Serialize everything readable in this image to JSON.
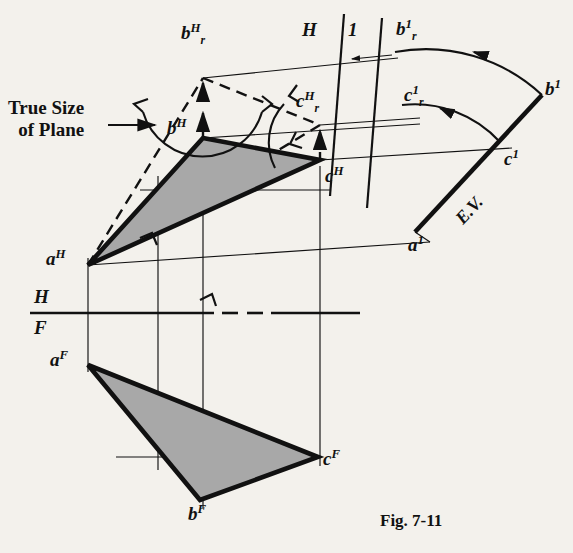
{
  "figure": {
    "caption": "Fig. 7-11",
    "paper_tint": "#f3f1ec",
    "ink_color": "#111111",
    "plane_fill": "#a8a8a8"
  },
  "annotations": {
    "true_size_line1": "True Size",
    "true_size_line2": "of Plane",
    "edge_view": "E.V.",
    "fold_h_top": "H",
    "fold_1_top": "1",
    "fold_h_lower": "H",
    "fold_f_lower": "F"
  },
  "points": {
    "a_h": {
      "base": "a",
      "sup": "H",
      "sub": "",
      "x": 88,
      "y": 265,
      "lx": 46,
      "ly": 248
    },
    "b_h": {
      "base": "b",
      "sup": "H",
      "sub": "",
      "x": 203,
      "y": 138,
      "lx": 167,
      "ly": 117
    },
    "c_h": {
      "base": "c",
      "sup": "H",
      "sub": "",
      "x": 320,
      "y": 160,
      "lx": 325,
      "ly": 165
    },
    "br_h": {
      "base": "b",
      "sup": "H",
      "sub": "r",
      "x": 203,
      "y": 78,
      "lx": 181,
      "ly": 22
    },
    "cr_h": {
      "base": "c",
      "sup": "H",
      "sub": "r",
      "x": 320,
      "y": 125,
      "lx": 296,
      "ly": 90
    },
    "a_1": {
      "base": "a",
      "sup": "1",
      "sub": "",
      "x": 415,
      "y": 232,
      "lx": 408,
      "ly": 234
    },
    "b_1": {
      "base": "b",
      "sup": "1",
      "sub": "",
      "x": 542,
      "y": 95,
      "lx": 545,
      "ly": 78
    },
    "c_1": {
      "base": "c",
      "sup": "1",
      "sub": "",
      "x": 500,
      "y": 142,
      "lx": 504,
      "ly": 148
    },
    "br_1": {
      "base": "b",
      "sup": "1",
      "sub": "r",
      "x": 393,
      "y": 52,
      "lx": 396,
      "ly": 18
    },
    "cr_1": {
      "base": "c",
      "sup": "1",
      "sub": "r",
      "x": 401,
      "y": 104,
      "lx": 404,
      "ly": 84
    },
    "a_f": {
      "base": "a",
      "sup": "F",
      "sub": "",
      "x": 88,
      "y": 365,
      "lx": 50,
      "ly": 349
    },
    "b_f": {
      "base": "b",
      "sup": "F",
      "sub": "",
      "x": 200,
      "y": 500,
      "lx": 188,
      "ly": 503
    },
    "c_f": {
      "base": "c",
      "sup": "F",
      "sub": "",
      "x": 318,
      "y": 457,
      "lx": 323,
      "ly": 448
    }
  },
  "geometry": {
    "top_view_triangle": "88,265 203,138 320,160",
    "front_view_triangle": "88,365 200,500 318,457",
    "true_size_triangle": "88,265 203,78 320,125",
    "edge_view_path": "415,232 500,142 542,95",
    "hf_line_y": 313,
    "hf_line_x1": 30,
    "hf_line_x2": 360,
    "hf_gap_x1": 214,
    "hf_gap_x2": 252,
    "fold_h1_top": "344,14 330,196",
    "fold_2_top": "382,18 367,208"
  },
  "labels_positions": {
    "true_size_x": 8,
    "true_size_y": 97,
    "ev_x": 452,
    "ev_y": 172,
    "fold_h_top_x": 302,
    "fold_h_top_y": 20,
    "fold_1_top_x": 348,
    "fold_1_top_y": 20,
    "fold_h_lower_x": 34,
    "fold_h_lower_y": 287,
    "fold_f_lower_x": 34,
    "fold_f_lower_y": 318,
    "caption_x": 380,
    "caption_y": 512
  }
}
